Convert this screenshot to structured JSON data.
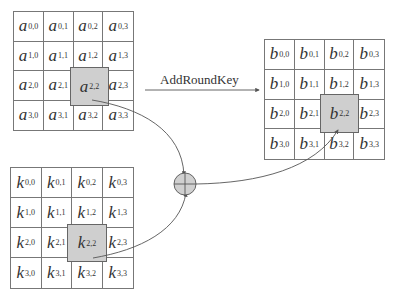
{
  "operation_label": "AddRoundKey",
  "matrices": {
    "a": {
      "symbol": "a",
      "cells": [
        [
          "0,0",
          "0,1",
          "0,2",
          "0,3"
        ],
        [
          "1,0",
          "1,1",
          "1,2",
          "1,3"
        ],
        [
          "2,0",
          "2,1",
          "2,2",
          "2,3"
        ],
        [
          "3,0",
          "3,1",
          "3,2",
          "3,3"
        ]
      ],
      "highlight": "2,2"
    },
    "b": {
      "symbol": "b",
      "cells": [
        [
          "0,0",
          "0,1",
          "0,2",
          "0,3"
        ],
        [
          "1,0",
          "1,1",
          "1,2",
          "1,3"
        ],
        [
          "2,0",
          "2,1",
          "2,2",
          "2,3"
        ],
        [
          "3,0",
          "3,1",
          "3,2",
          "3,3"
        ]
      ],
      "highlight": "2,2"
    },
    "k": {
      "symbol": "k",
      "cells": [
        [
          "0,0",
          "0,1",
          "0,2",
          "0,3"
        ],
        [
          "1,0",
          "1,1",
          "1,2",
          "1,3"
        ],
        [
          "2,0",
          "2,1",
          "2,2",
          "2,3"
        ],
        [
          "3,0",
          "3,1",
          "3,2",
          "3,3"
        ]
      ],
      "highlight": "2,2"
    }
  },
  "xor_symbol": "⊕",
  "colors": {
    "line": "#555555",
    "highlight": "#cfcfcf",
    "xor_fill": "#d0d0d0"
  }
}
